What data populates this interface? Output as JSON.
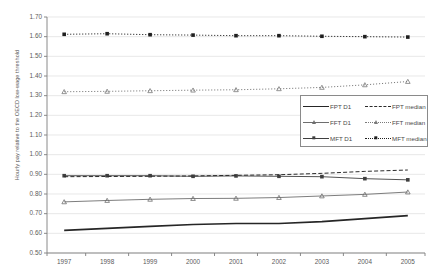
{
  "chart_data": {
    "type": "line",
    "title": "",
    "xlabel": "",
    "ylabel": "Hourly pay relative to the OECD low-wage threshold",
    "x": [
      1997,
      1998,
      1999,
      2000,
      2001,
      2002,
      2003,
      2004,
      2005
    ],
    "categories": [
      "1997",
      "1998",
      "1999",
      "2000",
      "2001",
      "2002",
      "2003",
      "2004",
      "2005"
    ],
    "xlim": [
      1996.6,
      2005.4
    ],
    "ylim": [
      0.5,
      1.7
    ],
    "yticks": [
      "0.50",
      "0.60",
      "0.70",
      "0.80",
      "0.90",
      "1.00",
      "1.10",
      "1.20",
      "1.30",
      "1.40",
      "1.50",
      "1.60",
      "1.70"
    ],
    "grid": true,
    "legend_position": "center-right",
    "series": [
      {
        "name": "FPT D1",
        "style": "solid-thick",
        "marker": "none",
        "color": "#262626",
        "values": [
          0.615,
          0.625,
          0.635,
          0.645,
          0.65,
          0.65,
          0.66,
          0.675,
          0.69
        ]
      },
      {
        "name": "FFT D1",
        "style": "solid-thin",
        "marker": "triangle",
        "color": "#6e6e6e",
        "values": [
          0.76,
          0.767,
          0.773,
          0.777,
          0.778,
          0.782,
          0.79,
          0.798,
          0.81
        ]
      },
      {
        "name": "MFT D1",
        "style": "solid-thin",
        "marker": "square",
        "color": "#3f3f3f",
        "values": [
          0.893,
          0.893,
          0.893,
          0.89,
          0.892,
          0.89,
          0.888,
          0.878,
          0.872
        ]
      },
      {
        "name": "FPT median",
        "style": "dashed",
        "marker": "none",
        "color": "#2b2b2b",
        "values": [
          0.888,
          0.889,
          0.89,
          0.892,
          0.895,
          0.898,
          0.905,
          0.915,
          0.922
        ]
      },
      {
        "name": "FFT median",
        "style": "dotted",
        "marker": "triangle",
        "color": "#7a7a7a",
        "values": [
          1.32,
          1.322,
          1.325,
          1.328,
          1.33,
          1.335,
          1.342,
          1.355,
          1.372
        ]
      },
      {
        "name": "MFT median",
        "style": "dotted",
        "marker": "square",
        "color": "#1f1f1f",
        "values": [
          1.612,
          1.615,
          1.61,
          1.608,
          1.605,
          1.605,
          1.602,
          1.6,
          1.598
        ]
      }
    ]
  },
  "legend": {
    "rows": [
      {
        "left": "FPT D1",
        "right": "FPT median"
      },
      {
        "left": "FFT D1",
        "right": "FFT median"
      },
      {
        "left": "MFT D1",
        "right": "MFT median"
      }
    ]
  }
}
